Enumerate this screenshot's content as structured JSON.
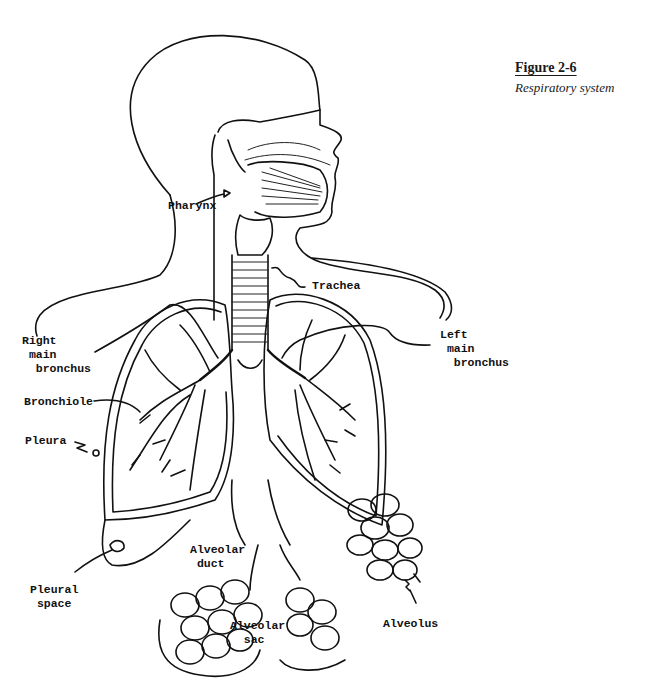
{
  "figure": {
    "number": "Figure 2-6",
    "title": "Respiratory system"
  },
  "labels": {
    "pharynx": "Pharynx",
    "trachea": "Trachea",
    "right_main_bronchus": "Right\n main\n  bronchus",
    "left_main_bronchus": "Left\n main\n  bronchus",
    "bronchiole": "Bronchiole",
    "pleura": "Pleura",
    "pleural_space": "Pleural\n space",
    "alveolar_duct": "Alveolar\n duct",
    "alveolar_sac": "Alveolar\n  sac",
    "alveolus": "Alveolus"
  },
  "colors": {
    "ink": "#111111",
    "background": "#ffffff"
  }
}
